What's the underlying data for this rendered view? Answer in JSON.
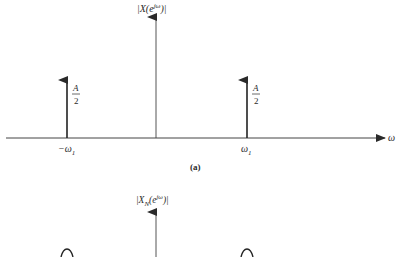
{
  "figure_a": {
    "ylabel": "|X(e^{jω})|",
    "ylabel_base": "|X(e",
    "ylabel_sup": "jω",
    "ylabel_tail": ")|",
    "xlabel": "ω",
    "caption": "(a)",
    "impulses": [
      {
        "position_label_prefix": "−ω",
        "position_label_sub": "1",
        "amplitude_num": "A",
        "amplitude_den": "2"
      },
      {
        "position_label_prefix": "ω",
        "position_label_sub": "1",
        "amplitude_num": "A",
        "amplitude_den": "2"
      }
    ]
  },
  "figure_b": {
    "ylabel": "|X_N(e^{jω})|",
    "ylabel_base": "|X",
    "ylabel_sub": "N",
    "ylabel_mid": "(e",
    "ylabel_sup": "jω",
    "ylabel_tail": ")|"
  },
  "colors": {
    "ink": "#2a2a2a",
    "background": "#ffffff"
  }
}
